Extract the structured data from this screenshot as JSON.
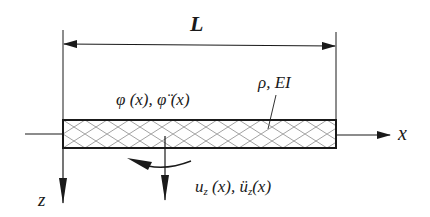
{
  "diagram": {
    "type": "beam-schematic",
    "labels": {
      "length": "L",
      "rotation": "φ (x), φ̈ (x)",
      "material": "ρ, EI",
      "x_axis": "x",
      "z_axis": "z",
      "displacement": "u",
      "displacement_sub": "z",
      "displacement_args": " (x), ",
      "accel": "ü",
      "accel_sub": "z",
      "accel_args": "(x)"
    },
    "colors": {
      "stroke": "#1a1a1a",
      "hatch": "#8a8a8a",
      "background": "#ffffff"
    }
  }
}
